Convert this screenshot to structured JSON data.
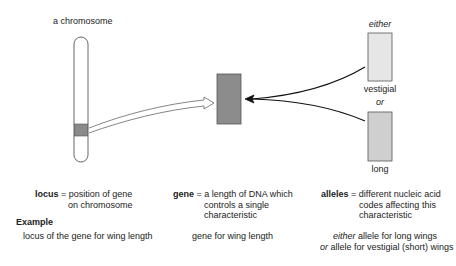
{
  "labels": {
    "chromosome": "a chromosome",
    "either": "either",
    "vestigial": "vestigial",
    "or": "or",
    "long": "long"
  },
  "definitions": {
    "locus": {
      "term": "locus",
      "eq": " = ",
      "line1": "position of gene",
      "line2": "on chromosome"
    },
    "gene": {
      "term": "gene",
      "eq": " = ",
      "line1": "a length of DNA which",
      "line2": "controls a single",
      "line3": "characteristic"
    },
    "alleles": {
      "term": "alleles",
      "eq": " = ",
      "line1": "different nucleic acid",
      "line2": "codes affecting this",
      "line3": "characteristic"
    }
  },
  "example": {
    "heading": "Example",
    "locus": "locus of the gene for wing length",
    "gene": "gene for wing length",
    "alleles_line1_prefix": "either",
    "alleles_line1_rest": " allele for long wings",
    "alleles_line2_prefix": "or",
    "alleles_line2_rest": " allele for vestigial (short) wings"
  },
  "colors": {
    "chromosome_band": "#8a8a8a",
    "gene_block": "#8c8c8c",
    "allele_vestigial": "#e6e6e6",
    "allele_long": "#cfcfcf",
    "outline": "#555555"
  }
}
